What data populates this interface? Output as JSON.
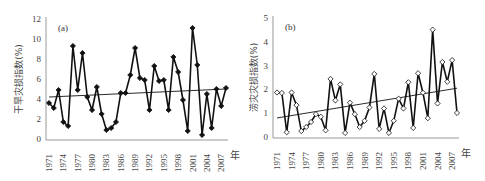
{
  "chart_data": [
    {
      "type": "line",
      "panel_label": "(a)",
      "title": "",
      "xlabel": "年",
      "ylabel": "干旱灾损指数(%)",
      "ylim": [
        0,
        12
      ],
      "yticks": [
        0,
        2,
        4,
        6,
        8,
        10,
        12
      ],
      "xtick_labels": [
        "1971",
        "1974",
        "1977",
        "1980",
        "1983",
        "1986",
        "1989",
        "1992",
        "1995",
        "1998",
        "2001",
        "2004",
        "2007"
      ],
      "x": [
        1971,
        1972,
        1973,
        1974,
        1975,
        1976,
        1977,
        1978,
        1979,
        1980,
        1981,
        1982,
        1983,
        1984,
        1985,
        1986,
        1987,
        1988,
        1989,
        1990,
        1991,
        1992,
        1993,
        1994,
        1995,
        1996,
        1997,
        1998,
        1999,
        2000,
        2001,
        2002,
        2003,
        2004,
        2005,
        2006,
        2007,
        2008
      ],
      "series": [
        {
          "name": "干旱灾损指数",
          "marker": "filled-diamond",
          "values": [
            3.6,
            3.1,
            4.9,
            1.7,
            1.3,
            9.3,
            4.9,
            8.6,
            4.2,
            2.9,
            5.2,
            2.5,
            0.9,
            1.1,
            1.7,
            4.6,
            4.6,
            6.4,
            9.1,
            6.1,
            5.9,
            2.9,
            7.3,
            5.8,
            5.9,
            2.9,
            8.2,
            6.7,
            3.9,
            0.8,
            11.1,
            7.4,
            0.4,
            4.5,
            1.1,
            5.0,
            3.3,
            5.1
          ]
        },
        {
          "name": "trend",
          "type": "linear",
          "start": 4.2,
          "end": 5.0
        }
      ],
      "grid": false,
      "legend": "none"
    },
    {
      "type": "line",
      "panel_label": "(b)",
      "title": "",
      "xlabel": "年",
      "ylabel": "涝灾灾损指数(%)",
      "ylim": [
        0,
        5
      ],
      "yticks": [
        0,
        1,
        2,
        3,
        4,
        5
      ],
      "xtick_labels": [
        "1971",
        "1974",
        "1977",
        "1980",
        "1983",
        "1986",
        "1989",
        "1992",
        "1995",
        "1998",
        "2001",
        "2004",
        "2007"
      ],
      "x": [
        1971,
        1972,
        1973,
        1974,
        1975,
        1976,
        1977,
        1978,
        1979,
        1980,
        1981,
        1982,
        1983,
        1984,
        1985,
        1986,
        1987,
        1988,
        1989,
        1990,
        1991,
        1992,
        1993,
        1994,
        1995,
        1996,
        1997,
        1998,
        1999,
        2000,
        2001,
        2002,
        2003,
        2004,
        2005,
        2006,
        2007,
        2008
      ],
      "series": [
        {
          "name": "涝灾灾损指数",
          "marker": "open-diamond",
          "values": [
            1.87,
            1.85,
            0.2,
            1.87,
            1.34,
            0.25,
            0.42,
            0.63,
            0.96,
            0.85,
            0.28,
            2.44,
            1.54,
            2.21,
            0.17,
            1.44,
            0.96,
            0.42,
            0.68,
            1.24,
            2.65,
            0.34,
            1.2,
            0.17,
            0.68,
            1.61,
            1.2,
            2.3,
            0.38,
            2.68,
            1.86,
            0.79,
            4.51,
            1.41,
            3.15,
            2.32,
            3.23,
            1.01
          ]
        },
        {
          "name": "trend",
          "type": "linear",
          "start": 0.8,
          "end": 2.05
        }
      ],
      "grid": false,
      "legend": "none"
    }
  ],
  "colors": {
    "line": "#111111",
    "axis": "#999999",
    "text": "#444444"
  }
}
